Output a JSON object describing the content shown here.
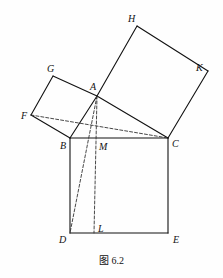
{
  "figure": {
    "caption": "图 6.2",
    "caption_x": 0,
    "caption_y": 252,
    "width": 223,
    "height": 278,
    "background_color": "#fefefe",
    "stroke_color": "#111111",
    "dashed_stroke_color": "#333333",
    "solid_stroke_width": 1.1,
    "dashed_stroke_width": 0.9,
    "dash_pattern": "3,2"
  },
  "points": {
    "A": {
      "x": 97,
      "y": 96,
      "label": "A",
      "label_x": 90,
      "label_y": 82
    },
    "B": {
      "x": 70,
      "y": 138,
      "label": "B",
      "label_x": 60,
      "label_y": 141
    },
    "C": {
      "x": 168,
      "y": 138,
      "label": "C",
      "label_x": 172,
      "label_y": 139
    },
    "D": {
      "x": 70,
      "y": 233,
      "label": "D",
      "label_x": 59,
      "label_y": 235
    },
    "E": {
      "x": 168,
      "y": 233,
      "label": "E",
      "label_x": 173,
      "label_y": 235
    },
    "F": {
      "x": 31,
      "y": 115,
      "label": "F",
      "label_x": 21,
      "label_y": 111
    },
    "G": {
      "x": 53,
      "y": 76,
      "label": "G",
      "label_x": 47,
      "label_y": 64
    },
    "H": {
      "x": 137,
      "y": 26,
      "label": "H",
      "label_x": 128,
      "label_y": 14
    },
    "K": {
      "x": 208,
      "y": 71,
      "label": "K",
      "label_x": 196,
      "label_y": 63
    },
    "L": {
      "x": 94,
      "y": 233,
      "label": "L",
      "label_x": 98,
      "label_y": 224
    },
    "M": {
      "x": 94,
      "y": 138,
      "label": "M",
      "label_x": 99,
      "label_y": 142
    }
  },
  "solid_segments": [
    {
      "name": "segment-B-C",
      "from": "B",
      "to": "C"
    },
    {
      "name": "segment-B-D",
      "from": "B",
      "to": "D"
    },
    {
      "name": "segment-D-E",
      "from": "D",
      "to": "E"
    },
    {
      "name": "segment-E-C",
      "from": "E",
      "to": "C"
    },
    {
      "name": "segment-A-B",
      "from": "A",
      "to": "B"
    },
    {
      "name": "segment-A-C",
      "from": "A",
      "to": "C"
    },
    {
      "name": "segment-B-F",
      "from": "B",
      "to": "F"
    },
    {
      "name": "segment-F-G",
      "from": "F",
      "to": "G"
    },
    {
      "name": "segment-G-A",
      "from": "G",
      "to": "A"
    },
    {
      "name": "segment-A-H",
      "from": "A",
      "to": "H"
    },
    {
      "name": "segment-H-K",
      "from": "H",
      "to": "K"
    },
    {
      "name": "segment-K-C",
      "from": "K",
      "to": "C"
    }
  ],
  "dashed_segments": [
    {
      "name": "segment-F-C",
      "from": "F",
      "to": "C"
    },
    {
      "name": "segment-A-D",
      "from": "A",
      "to": "D"
    },
    {
      "name": "segment-A-L",
      "from": "A",
      "to": "L"
    }
  ],
  "labels_order": [
    "H",
    "G",
    "K",
    "A",
    "F",
    "B",
    "C",
    "M",
    "D",
    "L",
    "E"
  ]
}
